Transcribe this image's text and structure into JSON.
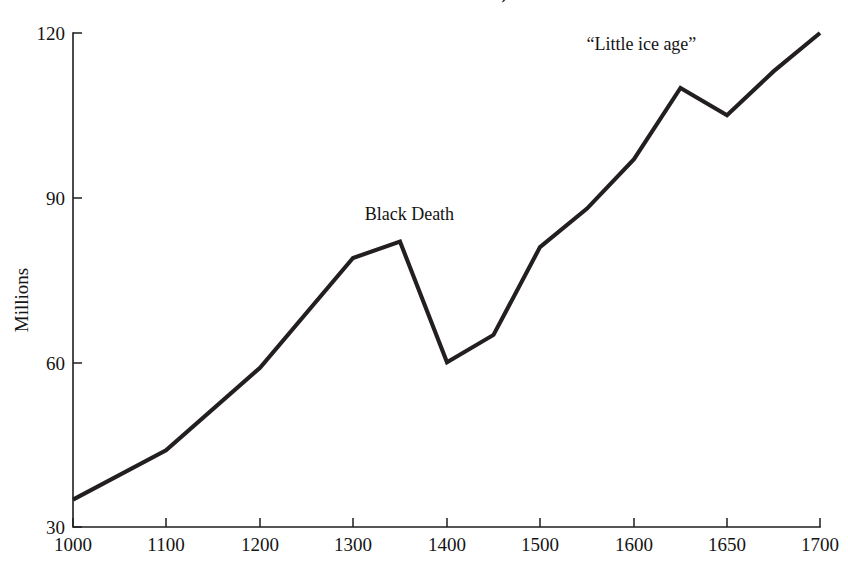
{
  "chart_data": {
    "type": "line",
    "title": "of the Ural Mountains)",
    "title_note": "heading is cropped at the top edge of the screenshot",
    "xlabel": "",
    "ylabel": "Millions",
    "xlim": [
      1000,
      1700
    ],
    "ylim": [
      30,
      120
    ],
    "grid": false,
    "legend": null,
    "x_ticks": [
      "1000",
      "1100",
      "1200",
      "1300",
      "1400",
      "1500",
      "1600",
      "1650",
      "1700"
    ],
    "y_ticks": [
      "30",
      "60",
      "90",
      "120"
    ],
    "x": [
      1000,
      1100,
      1200,
      1300,
      1350,
      1400,
      1450,
      1500,
      1550,
      1600,
      1625,
      1650,
      1675,
      1700
    ],
    "values": [
      35,
      44,
      59,
      79,
      82,
      60,
      65,
      81,
      88,
      97,
      110,
      105,
      113,
      120
    ],
    "series": [
      {
        "name": "Population",
        "values": [
          35,
          44,
          59,
          79,
          82,
          60,
          65,
          81,
          88,
          97,
          110,
          105,
          113,
          120
        ]
      }
    ],
    "annotations": [
      {
        "text": "Black Death",
        "x": 1360,
        "y": 86
      },
      {
        "text": "“Little ice age”",
        "x": 1604,
        "y": 117
      }
    ]
  },
  "axis": {
    "y_label": "Millions"
  }
}
